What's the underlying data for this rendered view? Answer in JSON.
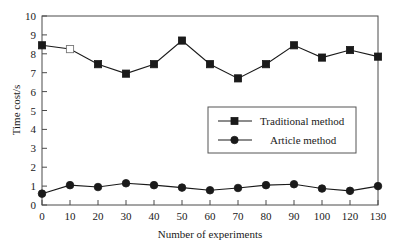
{
  "chart_data": {
    "type": "line",
    "title": "",
    "xlabel": "Number of experiments",
    "ylabel": "Time cost/s",
    "x": [
      0,
      10,
      20,
      30,
      40,
      50,
      60,
      70,
      80,
      90,
      100,
      120,
      130
    ],
    "xtick_labels": [
      "0",
      "10",
      "20",
      "30",
      "40",
      "50",
      "60",
      "70",
      "80",
      "90",
      "100",
      "120",
      "130"
    ],
    "ytick_labels": [
      "0",
      "1",
      "2",
      "3",
      "4",
      "5",
      "6",
      "7",
      "8",
      "9",
      "10"
    ],
    "ylim": [
      0,
      10
    ],
    "ytick_step": 1,
    "grid": false,
    "legend_position": "center-right",
    "series": [
      {
        "name": "Traditional method",
        "marker": "square",
        "values": [
          8.45,
          8.25,
          7.45,
          6.95,
          7.45,
          8.7,
          7.45,
          6.7,
          7.45,
          8.45,
          7.8,
          8.2,
          7.85
        ],
        "hollow_marker_indices": [
          1
        ]
      },
      {
        "name": "Article method",
        "marker": "circle",
        "values": [
          0.6,
          1.05,
          0.95,
          1.15,
          1.05,
          0.92,
          0.78,
          0.9,
          1.05,
          1.1,
          0.87,
          0.75,
          1.0
        ],
        "hollow_marker_indices": []
      }
    ]
  },
  "axes": {
    "y_axis_title": "Time cost/s",
    "x_axis_title": "Number of experiments",
    "y_ticks": [
      "10",
      "9",
      "8",
      "7",
      "6",
      "5",
      "4",
      "3",
      "2",
      "1",
      "0"
    ],
    "x_ticks": [
      "0",
      "10",
      "20",
      "30",
      "40",
      "50",
      "60",
      "70",
      "80",
      "90",
      "100",
      "120",
      "130"
    ]
  },
  "legend": {
    "entries": [
      {
        "label": "Traditional method",
        "marker": "square-marker"
      },
      {
        "label": "Article method",
        "marker": "circle-marker"
      }
    ]
  },
  "colors": {
    "line": "#1a1a1a",
    "frame": "#4a4a4a",
    "background": "#ffffff",
    "hollow_marker_fill": "#ffffff"
  }
}
